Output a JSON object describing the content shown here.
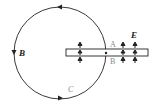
{
  "diagram": {
    "labels": {
      "B_field": "B",
      "E_field": "E",
      "point_A": "A",
      "point_B": "B",
      "curve_C": "C"
    },
    "colors": {
      "stroke": "#222222",
      "label_gray": "#8a8a8a",
      "background": "#ffffff"
    },
    "circle": {
      "cx": 60,
      "cy": 53,
      "r": 46
    },
    "capacitor_strip": {
      "x": 66,
      "y": 49,
      "width": 82,
      "height": 7
    },
    "e_arrow_columns_x": [
      80,
      123,
      135
    ]
  }
}
